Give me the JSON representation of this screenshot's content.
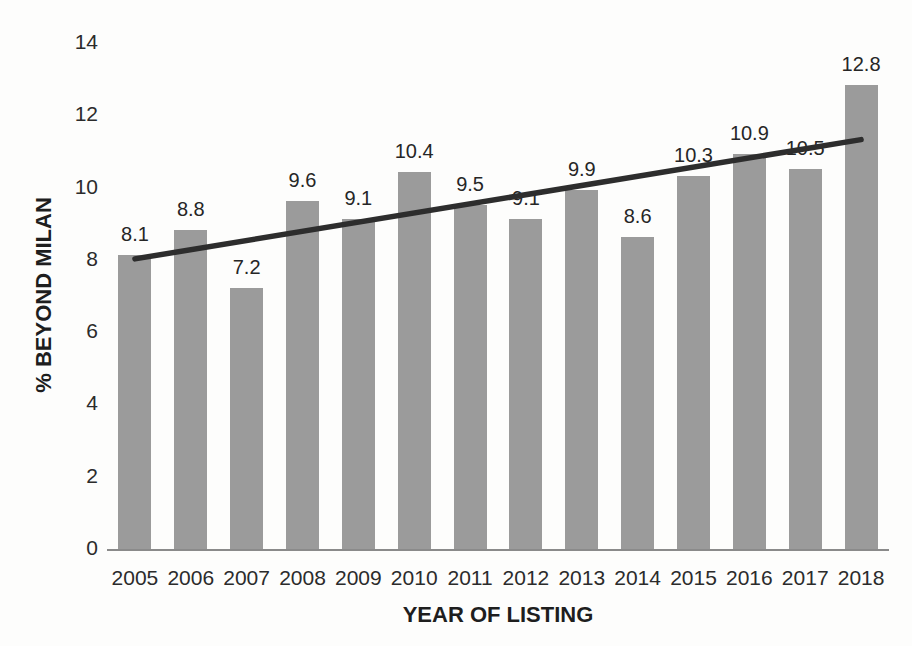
{
  "chart_data": {
    "type": "bar",
    "title": "",
    "xlabel": "YEAR OF LISTING",
    "ylabel": "% BEYOND MILAN",
    "categories": [
      "2005",
      "2006",
      "2007",
      "2008",
      "2009",
      "2010",
      "2011",
      "2012",
      "2013",
      "2014",
      "2015",
      "2016",
      "2017",
      "2018"
    ],
    "values": [
      8.1,
      8.8,
      7.2,
      9.6,
      9.1,
      10.4,
      9.5,
      9.1,
      9.9,
      8.6,
      10.3,
      10.9,
      10.5,
      12.8
    ],
    "data_labels": [
      "8.1",
      "8.8",
      "7.2",
      "9.6",
      "9.1",
      "10.4",
      "9.5",
      "9.1",
      "9.9",
      "8.6",
      "10.3",
      "10.9",
      "10.5",
      "12.8"
    ],
    "ylim": [
      0,
      14
    ],
    "yticks": [
      0,
      2,
      4,
      6,
      8,
      10,
      12,
      14
    ],
    "grid": false,
    "legend": "none",
    "bar_color": "#9b9b9b",
    "axis_line_color": "#8a8a8a",
    "trendline": {
      "type": "linear",
      "start_value": 8.0,
      "end_value": 11.3,
      "color": "#2d2d2d"
    }
  }
}
